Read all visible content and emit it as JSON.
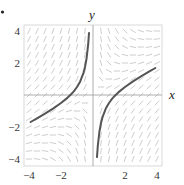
{
  "figure": {
    "marker": "•",
    "x_axis_label": "x",
    "y_axis_label": "y"
  },
  "chart_data": {
    "type": "line",
    "title": "",
    "subtitle": "Slope field with solution curve",
    "xlabel": "x",
    "ylabel": "y",
    "xlim": [
      -4.3,
      4.3
    ],
    "ylim": [
      -4.4,
      4.4
    ],
    "grid": false,
    "legend": null,
    "x_ticks": [
      -4,
      -2,
      2,
      4
    ],
    "x_tick_labels": [
      "−4",
      "−2",
      "2",
      "4"
    ],
    "y_ticks": [
      4,
      2,
      -2,
      -4
    ],
    "y_tick_labels": [
      "4",
      "2",
      "−2",
      "−4"
    ],
    "slope_field": {
      "equation": "dy/dx = 1 - y/x",
      "x_samples": [
        -4,
        -3.5,
        -3,
        -2.5,
        -2,
        -1.5,
        -1,
        -0.5,
        0.5,
        1,
        1.5,
        2,
        2.5,
        3,
        3.5,
        4
      ],
      "y_samples": [
        -4,
        -3.5,
        -3,
        -2.5,
        -2,
        -1.5,
        -1,
        -0.5,
        0,
        0.5,
        1,
        1.5,
        2,
        2.5,
        3,
        3.5,
        4
      ],
      "color": "#b8b8b8"
    },
    "series": [
      {
        "name": "solution y = x/2 - 1/x (left branch)",
        "color": "#555555",
        "x": [
          -3.9,
          -3.5,
          -3.0,
          -2.5,
          -2.0,
          -1.6,
          -1.4,
          -1.2,
          -1.0,
          -0.8,
          -0.6,
          -0.5,
          -0.4,
          -0.3,
          -0.25
        ],
        "y": [
          -1.69,
          -1.46,
          -1.17,
          -0.85,
          -0.5,
          -0.18,
          0.01,
          0.23,
          0.5,
          0.85,
          1.37,
          1.75,
          2.3,
          3.18,
          3.88
        ]
      },
      {
        "name": "solution y = x/2 - 1/x (right branch)",
        "color": "#555555",
        "x": [
          0.25,
          0.3,
          0.4,
          0.5,
          0.6,
          0.8,
          1.0,
          1.2,
          1.4,
          1.6,
          2.0,
          2.5,
          3.0,
          3.5,
          3.9
        ],
        "y": [
          -3.88,
          -3.18,
          -2.3,
          -1.75,
          -1.37,
          -0.85,
          -0.5,
          -0.23,
          -0.01,
          0.18,
          0.5,
          0.85,
          1.17,
          1.46,
          1.69
        ]
      }
    ]
  }
}
